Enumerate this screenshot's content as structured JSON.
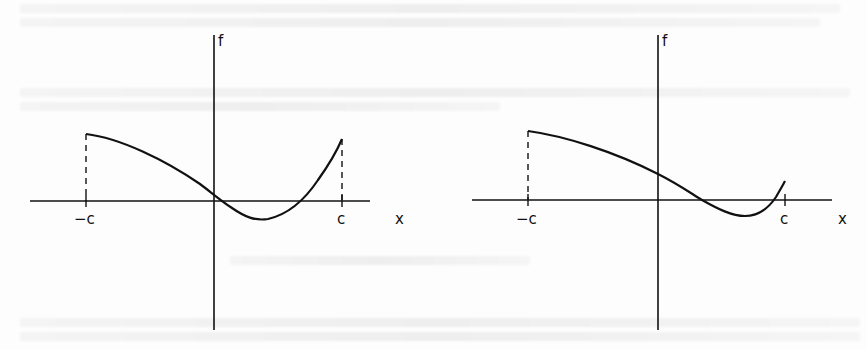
{
  "figure": {
    "stroke_color": "#111111",
    "background": "#fdfdfd",
    "graphs": [
      {
        "id": "left",
        "y_axis_label": "f",
        "x_axis_label": "x",
        "left_bound_label": "−c",
        "right_bound_label": "c",
        "axes": {
          "origin": [
            214,
            201
          ],
          "x_axis_range_px": [
            30,
            370
          ],
          "y_axis_range_px": [
            35,
            330
          ]
        },
        "bounds_px": {
          "neg_c": 86,
          "c": 342
        },
        "curve_path": "M86,134 C120,138 165,160 200,184 C212,193 220,200 232,208 C245,217 255,221 268,219 C290,214 306,198 318,180 C328,166 336,153 342,139",
        "left_dashed_top": 134,
        "right_dashed_top": 139
      },
      {
        "id": "right",
        "y_axis_label": "f",
        "x_axis_label": "x",
        "left_bound_label": "−c",
        "right_bound_label": "c",
        "axes": {
          "origin": [
            658,
            200
          ],
          "x_axis_range_px": [
            472,
            832
          ],
          "y_axis_range_px": [
            35,
            330
          ]
        },
        "bounds_px": {
          "neg_c": 528,
          "c": 785
        },
        "curve_path": "M528,131 C565,136 615,152 658,174 C678,184 692,194 702,200 C718,209 732,216 745,216 C760,216 770,206 776,197 C780,190 783,185 785,181",
        "left_dashed_top": 131,
        "right_dashed_top": null
      }
    ]
  }
}
